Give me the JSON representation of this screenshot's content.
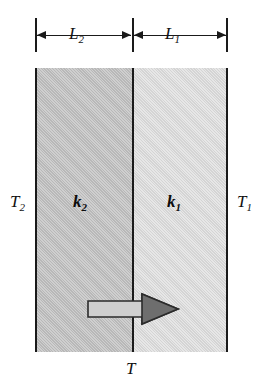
{
  "diagram": {
    "dimensions": [
      {
        "id": "L2",
        "label": "L",
        "subscript": "2",
        "side": "left"
      },
      {
        "id": "L1",
        "label": "L",
        "subscript": "1",
        "side": "right"
      }
    ],
    "layers": [
      {
        "id": "k2",
        "label": "k",
        "subscript": "2",
        "fill": "#c2c2c2",
        "position": "left"
      },
      {
        "id": "k1",
        "label": "k",
        "subscript": "1",
        "fill": "#dcdcdc",
        "position": "right"
      }
    ],
    "temperatures": [
      {
        "id": "T2",
        "label": "T",
        "subscript": "2",
        "position": "left-outside"
      },
      {
        "id": "T1",
        "label": "T",
        "subscript": "1",
        "position": "right-outside"
      },
      {
        "id": "T",
        "label": "T",
        "subscript": "",
        "position": "bottom-interface"
      }
    ],
    "heat_flow": {
      "direction": "right",
      "shaft_fill": "#c8c8c8",
      "head_fill": "#6e6e6e",
      "outline": "#2b2b2b"
    },
    "stroke_color": "#1a1a1a",
    "background": "#ffffff"
  }
}
